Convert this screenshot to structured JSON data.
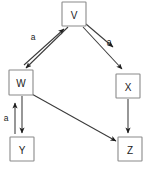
{
  "diagram": {
    "type": "directed-graph",
    "title": "",
    "canvas": {
      "width": 150,
      "height": 172,
      "background": "#ffffff"
    },
    "style": {
      "node_fill": "#ffffff",
      "node_border": "#8a8a8a",
      "edge_color": "#3a3a3a",
      "arrow_color": "#1d1d1d",
      "label_color": "#1b1b1b"
    },
    "nodes": [
      {
        "id": "V",
        "label": "V",
        "x": 62,
        "y": 2,
        "w": 24,
        "h": 24
      },
      {
        "id": "W",
        "label": "W",
        "x": 9,
        "y": 70,
        "w": 24,
        "h": 25
      },
      {
        "id": "X",
        "label": "X",
        "x": 116,
        "y": 74,
        "w": 24,
        "h": 24
      },
      {
        "id": "Y",
        "label": "Y",
        "x": 10,
        "y": 137,
        "w": 24,
        "h": 24
      },
      {
        "id": "Z",
        "label": "Z",
        "x": 118,
        "y": 137,
        "w": 24,
        "h": 24
      }
    ],
    "edges": [
      {
        "id": "e1",
        "from": "W",
        "to": "V",
        "label": "a",
        "direction": "up-right"
      },
      {
        "id": "e2",
        "from": "V",
        "to": "W",
        "label": "",
        "direction": "down-left"
      },
      {
        "id": "e3",
        "from": "V",
        "to": "X",
        "label": "a",
        "direction": "down-right"
      },
      {
        "id": "e4",
        "from": "V",
        "to": "X",
        "label": "",
        "direction": "down-right"
      },
      {
        "id": "e5",
        "from": "Y",
        "to": "W",
        "label": "a",
        "direction": "up"
      },
      {
        "id": "e6",
        "from": "W",
        "to": "Y",
        "label": "",
        "direction": "down"
      },
      {
        "id": "e7",
        "from": "W",
        "to": "Z",
        "label": "",
        "direction": "down-right"
      },
      {
        "id": "e8",
        "from": "X",
        "to": "Z",
        "label": "",
        "direction": "down"
      }
    ],
    "edge_labels": [
      {
        "id": "label-a-vw",
        "text": "a",
        "x": 33,
        "y": 37
      },
      {
        "id": "label-a-vx",
        "text": "a",
        "x": 109,
        "y": 42
      },
      {
        "id": "label-a-yw",
        "text": "a",
        "x": 6,
        "y": 118
      }
    ]
  }
}
